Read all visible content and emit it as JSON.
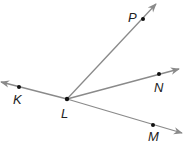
{
  "diagram": {
    "type": "geometry-rays",
    "colors": {
      "line": "#8a8a8a",
      "point": "#111111",
      "label": "#222222",
      "background": "#ffffff"
    },
    "vertex": {
      "name": "L",
      "x": 67,
      "y": 99
    },
    "points": [
      {
        "name": "K",
        "x": 19,
        "y": 87,
        "label_x": 13,
        "label_y": 104
      },
      {
        "name": "L",
        "x": 67,
        "y": 99,
        "label_x": 61,
        "label_y": 118
      },
      {
        "name": "P",
        "x": 143,
        "y": 19,
        "label_x": 128,
        "label_y": 22
      },
      {
        "name": "N",
        "x": 159,
        "y": 74,
        "label_x": 154,
        "label_y": 92
      },
      {
        "name": "M",
        "x": 153,
        "y": 125,
        "label_x": 148,
        "label_y": 142
      }
    ],
    "rays": [
      {
        "name": "ray-LK",
        "from": "L",
        "through": "K",
        "x2": 1,
        "y2": 82
      },
      {
        "name": "ray-LP",
        "from": "L",
        "through": "P",
        "x2": 156,
        "y2": 4
      },
      {
        "name": "ray-LN",
        "from": "L",
        "through": "N",
        "x2": 179,
        "y2": 69
      },
      {
        "name": "ray-LM",
        "from": "L",
        "through": "M",
        "x2": 182,
        "y2": 133
      }
    ],
    "labels": {
      "K": "K",
      "L": "L",
      "P": "P",
      "N": "N",
      "M": "M"
    }
  }
}
